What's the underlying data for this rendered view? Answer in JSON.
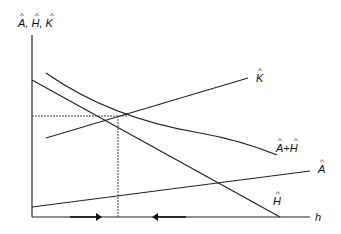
{
  "diagram": {
    "y_axis_label": "A, H, K",
    "x_axis_label": "h",
    "curves": [
      {
        "id": "K",
        "label": "K",
        "hat": true,
        "type": "line",
        "slope": "upward"
      },
      {
        "id": "A_plus_H",
        "label": "A+H",
        "hat": true,
        "type": "curve",
        "slope": "downward convex"
      },
      {
        "id": "A",
        "label": "A",
        "hat": true,
        "type": "line",
        "slope": "upward"
      },
      {
        "id": "H",
        "label": "H",
        "hat": true,
        "type": "line",
        "slope": "downward"
      }
    ],
    "equilibrium": {
      "description": "intersection of K and A+H",
      "dashed_guides": true
    },
    "arrows": [
      {
        "direction": "right",
        "position": "left of equilibrium"
      },
      {
        "direction": "left",
        "position": "right of equilibrium"
      }
    ],
    "hat_symbol": "^"
  }
}
